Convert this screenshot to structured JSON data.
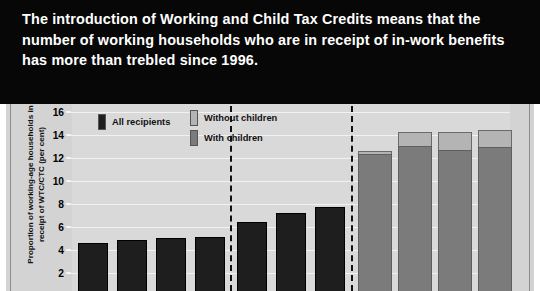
{
  "banner": {
    "title": "The introduction of Working and Child Tax Credits means that the number of working households who are in receipt of in-work benefits has more than trebled since 1996."
  },
  "chart_data": {
    "type": "bar",
    "title": "",
    "subtitle": "",
    "xlabel": "",
    "ylabel": "Proportion of working-age households in receipt of WTC/CTC (per cent)",
    "ylim": [
      0,
      16
    ],
    "ytick_values": [
      16,
      14,
      12,
      10,
      8,
      6,
      4,
      2
    ],
    "ytick_labels": [
      "16",
      "14",
      "12",
      "10",
      "8",
      "6",
      "4",
      "2"
    ],
    "grid": true,
    "legend_position": "top",
    "legend": [
      {
        "label": "All recipients",
        "color": "#1e1e1e"
      },
      {
        "label": "Without children",
        "color": "#b4b4b4"
      },
      {
        "label": "With children",
        "color": "#7b7b7b"
      }
    ],
    "groups": [
      {
        "name": "group-1",
        "stacked": false,
        "series": [
          {
            "name": "All recipients",
            "values": [
              4.2,
              4.4,
              4.6,
              4.7
            ]
          }
        ]
      },
      {
        "name": "group-2",
        "stacked": false,
        "series": [
          {
            "name": "All recipients",
            "values": [
              6.0,
              6.8,
              7.3
            ]
          }
        ]
      },
      {
        "name": "group-3",
        "stacked": true,
        "series": [
          {
            "name": "With children",
            "values": [
              11.9,
              12.6,
              12.3,
              12.5
            ]
          },
          {
            "name": "Without children",
            "values": [
              0.3,
              1.2,
              1.5,
              1.5
            ]
          }
        ],
        "totals": [
          12.2,
          13.8,
          13.8,
          14.0
        ]
      }
    ]
  }
}
